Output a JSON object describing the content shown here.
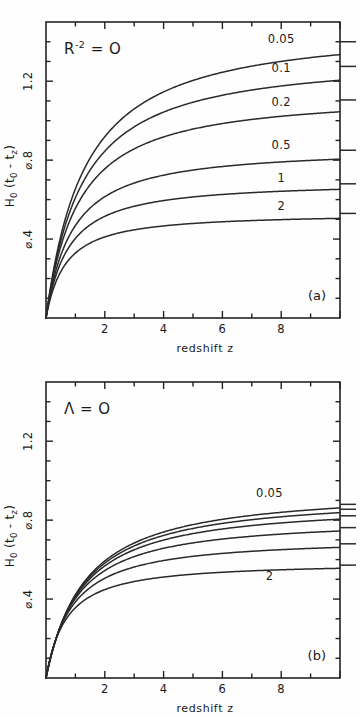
{
  "figure": {
    "name": "cosmic-lookback-time-vs-redshift",
    "background": "#fefefe",
    "ink_color": "#2a2a2a"
  },
  "chart_data": [
    {
      "type": "line",
      "panel_id": "(a)",
      "title": "",
      "annotation": "R⁻² = O",
      "annotation_base": "R",
      "annotation_exponent": "-2",
      "annotation_tail": "= O",
      "xlabel": "redshift  z",
      "ylabel": "H₀ (t₀ - tᶻ)",
      "ylabel_main": "H",
      "ylabel_sub0": "0",
      "ylabel_mid": " (t",
      "ylabel_sub1": "0",
      "ylabel_dash": " - t",
      "ylabel_sub2": "z",
      "ylabel_end": ")",
      "xlim": [
        0,
        10
      ],
      "ylim": [
        0,
        1.5
      ],
      "xticks": [
        1,
        2,
        3,
        4,
        5,
        6,
        7,
        8,
        9,
        10
      ],
      "xticklabels": [
        {
          "x": 2,
          "label": "2"
        },
        {
          "x": 4,
          "label": "4"
        },
        {
          "x": 6,
          "label": "6"
        },
        {
          "x": 8,
          "label": "8"
        }
      ],
      "yticks": [
        0.1,
        0.2,
        0.3,
        0.4,
        0.5,
        0.6,
        0.7,
        0.8,
        0.9,
        1.0,
        1.1,
        1.2,
        1.3,
        1.4
      ],
      "yticklabels": [
        {
          "y": 0.4,
          "label": "⌀.4"
        },
        {
          "y": 0.8,
          "label": "⌀.8"
        },
        {
          "y": 1.2,
          "label": "1.2"
        }
      ],
      "grid": false,
      "legend_position": "inline-right",
      "series": [
        {
          "name": "0.05",
          "label": "0.05",
          "asymptote": 1.4,
          "plateau": 1.335,
          "knee": 1.55,
          "label_x": 8.0,
          "label_y": 1.395
        },
        {
          "name": "0.1",
          "label": "0.1",
          "asymptote": 1.275,
          "plateau": 1.205,
          "knee": 1.45,
          "label_x": 8.0,
          "label_y": 1.245
        },
        {
          "name": "0.2",
          "label": "0.2",
          "asymptote": 1.105,
          "plateau": 1.045,
          "knee": 1.3,
          "label_x": 8.0,
          "label_y": 1.075
        },
        {
          "name": "0.5",
          "label": "0.5",
          "asymptote": 0.85,
          "plateau": 0.805,
          "knee": 1.05,
          "label_x": 8.0,
          "label_y": 0.855
        },
        {
          "name": "1",
          "label": "1",
          "asymptote": 0.68,
          "plateau": 0.652,
          "knee": 0.9,
          "label_x": 8.0,
          "label_y": 0.69
        },
        {
          "name": "2",
          "label": "2",
          "asymptote": 0.53,
          "plateau": 0.505,
          "knee": 0.78,
          "label_x": 8.0,
          "label_y": 0.545
        }
      ]
    },
    {
      "type": "line",
      "panel_id": "(b)",
      "title": "",
      "annotation": "Λ = O",
      "annotation_base": "Λ",
      "annotation_exponent": "",
      "annotation_tail": "= O",
      "xlabel": "redshift  z",
      "ylabel": "H₀ (t₀ - tᶻ)",
      "ylabel_main": "H",
      "ylabel_sub0": "0",
      "ylabel_mid": " (t",
      "ylabel_sub1": "0",
      "ylabel_dash": " - t",
      "ylabel_sub2": "z",
      "ylabel_end": ")",
      "xlim": [
        0,
        10
      ],
      "ylim": [
        0,
        1.5
      ],
      "xticks": [
        1,
        2,
        3,
        4,
        5,
        6,
        7,
        8,
        9,
        10
      ],
      "xticklabels": [
        {
          "x": 2,
          "label": "2"
        },
        {
          "x": 4,
          "label": "4"
        },
        {
          "x": 6,
          "label": "6"
        },
        {
          "x": 8,
          "label": "8"
        }
      ],
      "yticks": [
        0.1,
        0.2,
        0.3,
        0.4,
        0.5,
        0.6,
        0.7,
        0.8,
        0.9,
        1.0,
        1.1,
        1.2,
        1.3,
        1.4
      ],
      "yticklabels": [
        {
          "y": 0.4,
          "label": "⌀.4"
        },
        {
          "y": 0.8,
          "label": "⌀.8"
        },
        {
          "y": 1.2,
          "label": "1.2"
        }
      ],
      "grid": false,
      "legend_position": "inline-right",
      "series": [
        {
          "name": "0.05",
          "label": "0.05",
          "asymptote": 0.88,
          "plateau": 0.862,
          "knee": 1.55,
          "label_x": 7.6,
          "label_y": 0.915
        },
        {
          "name": "0.1",
          "label": "",
          "asymptote": 0.855,
          "plateau": 0.838,
          "knee": 1.5,
          "label_x": 0,
          "label_y": 0
        },
        {
          "name": "0.2",
          "label": "",
          "asymptote": 0.822,
          "plateau": 0.805,
          "knee": 1.42,
          "label_x": 0,
          "label_y": 0
        },
        {
          "name": "0.5",
          "label": "",
          "asymptote": 0.762,
          "plateau": 0.745,
          "knee": 1.25,
          "label_x": 0,
          "label_y": 0
        },
        {
          "name": "1",
          "label": "",
          "asymptote": 0.68,
          "plateau": 0.662,
          "knee": 1.05,
          "label_x": 0,
          "label_y": 0
        },
        {
          "name": "2",
          "label": "2",
          "asymptote": 0.572,
          "plateau": 0.556,
          "knee": 0.82,
          "label_x": 7.6,
          "label_y": 0.495
        }
      ]
    }
  ]
}
